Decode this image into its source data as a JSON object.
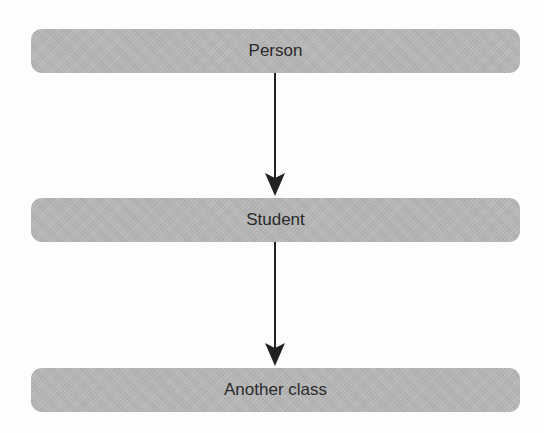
{
  "diagram": {
    "type": "inheritance-hierarchy",
    "nodes": [
      {
        "id": "person",
        "label": "Person"
      },
      {
        "id": "student",
        "label": "Student"
      },
      {
        "id": "another",
        "label": "Another class"
      }
    ],
    "edges": [
      {
        "from": "person",
        "to": "student"
      },
      {
        "from": "student",
        "to": "another"
      }
    ],
    "colors": {
      "node_fill": "#b9b9b9",
      "text": "#2a2a2a",
      "arrow": "#222222",
      "background": "#fdfdfd"
    }
  }
}
